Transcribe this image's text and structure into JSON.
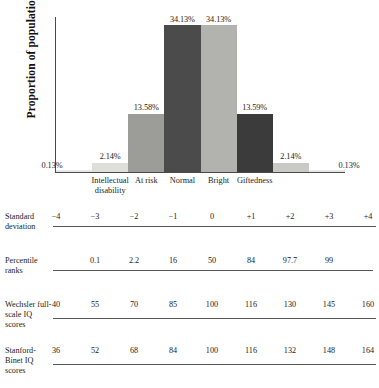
{
  "chart_data": {
    "type": "bar",
    "title": "",
    "xlabel": "",
    "ylabel": "Proportion of population",
    "ylim": [
      0,
      36
    ],
    "grid": false,
    "legend": "none",
    "categories": [
      "Intellectual disability",
      "At risk",
      "Normal",
      "Bright",
      "Giftedness"
    ],
    "bars": [
      {
        "label": "0.13%",
        "value": 0.13,
        "color": "#e8e8e6",
        "sd_from": -4,
        "sd_to": -3
      },
      {
        "label": "2.14%",
        "value": 2.14,
        "color": "#dededa",
        "sd_from": -3,
        "sd_to": -2
      },
      {
        "label": "13.58%",
        "value": 13.58,
        "color": "#9c9c98",
        "sd_from": -2,
        "sd_to": -1
      },
      {
        "label": "34.13%",
        "value": 34.13,
        "color": "#4b4b4b",
        "sd_from": -1,
        "sd_to": 0
      },
      {
        "label": "34.13%",
        "value": 34.13,
        "color": "#b2b2ae",
        "sd_from": 0,
        "sd_to": 1
      },
      {
        "label": "13.59%",
        "value": 13.59,
        "color": "#3b3b3b",
        "sd_from": 1,
        "sd_to": 2
      },
      {
        "label": "2.14%",
        "value": 2.14,
        "color": "#c9c9c5",
        "sd_from": 2,
        "sd_to": 3
      },
      {
        "label": "0.13%",
        "value": 0.13,
        "color": "#e8e8e6",
        "sd_from": 3,
        "sd_to": 4
      }
    ],
    "scale_rows": [
      {
        "name": "standard-deviation",
        "label": "Standard deviation",
        "values": [
          "−4",
          "−3",
          "−2",
          "−1",
          "0",
          "+1",
          "+2",
          "+3",
          "+4"
        ]
      },
      {
        "name": "percentile-ranks",
        "label": "Percentile ranks",
        "values": [
          "",
          "0.1",
          "2.2",
          "16",
          "50",
          "84",
          "97.7",
          "99",
          ""
        ]
      },
      {
        "name": "wechsler-iq",
        "label": "Wechsler full-scale IQ scores",
        "values": [
          "40",
          "55",
          "70",
          "85",
          "100",
          "116",
          "130",
          "145",
          "160"
        ]
      },
      {
        "name": "stanford-binet-iq",
        "label": "Stanford-Binet IQ scores",
        "values": [
          "36",
          "52",
          "68",
          "84",
          "100",
          "116",
          "132",
          "148",
          "164"
        ]
      }
    ]
  }
}
